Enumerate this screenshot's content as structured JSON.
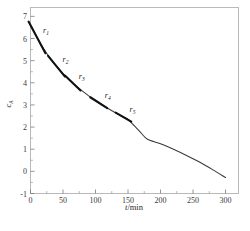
{
  "figure": {
    "background_color": "#ffffff",
    "frame_color": "#b9b9b9",
    "curve_color": "#3a3a3a",
    "tangent_color": "#111111"
  },
  "chart_data": {
    "type": "line",
    "title": "",
    "subtitle": "",
    "xlabel": "t/min",
    "xlabel_symbol": "t",
    "xlabel_unit": "/min",
    "ylabel": "cA",
    "ylabel_symbol": "c",
    "ylabel_subscript": "A",
    "xlim": [
      0,
      320
    ],
    "ylim": [
      -1,
      7.4
    ],
    "xticks": [
      0,
      50,
      100,
      150,
      200,
      250,
      300
    ],
    "xtick_labels": [
      "0",
      "50",
      "100",
      "150",
      "200",
      "250",
      "300"
    ],
    "xminor_step": 25,
    "yticks": [
      -1,
      0,
      1,
      2,
      3,
      4,
      5,
      6,
      7
    ],
    "ytick_labels": [
      "-1",
      "0",
      "1",
      "2",
      "3",
      "4",
      "5",
      "6",
      "7"
    ],
    "yminor_step": 0.5,
    "grid": false,
    "legend": false,
    "series": [
      {
        "name": "cA",
        "x": [
          0,
          10,
          20,
          30,
          40,
          50,
          60,
          70,
          80,
          90,
          100,
          110,
          120,
          130,
          140,
          150,
          160,
          170,
          180,
          200,
          220,
          240,
          260,
          280,
          300
        ],
        "y": [
          6.6,
          6.05,
          5.55,
          5.12,
          4.75,
          4.42,
          4.12,
          3.86,
          3.62,
          3.4,
          3.2,
          3.01,
          2.83,
          2.66,
          2.5,
          2.34,
          2.05,
          1.74,
          1.45,
          1.25,
          1.0,
          0.72,
          0.42,
          0.08,
          -0.28
        ]
      }
    ],
    "annotations": [
      {
        "label": "r1",
        "symbol": "r",
        "subscript": "1",
        "t": 10,
        "c": 6.05,
        "slope": -0.055,
        "half_len": 13,
        "label_dx": 9,
        "label_dy": -4
      },
      {
        "label": "r2",
        "symbol": "r",
        "subscript": "2",
        "t": 40,
        "c": 4.75,
        "slope": -0.036,
        "half_len": 13,
        "label_dx": 9,
        "label_dy": -4
      },
      {
        "label": "r3",
        "symbol": "r",
        "subscript": "3",
        "t": 65,
        "c": 3.99,
        "slope": -0.028,
        "half_len": 12,
        "label_dx": 9,
        "label_dy": -4
      },
      {
        "label": "r4",
        "symbol": "r",
        "subscript": "4",
        "t": 105,
        "c": 3.1,
        "slope": -0.019,
        "half_len": 13,
        "label_dx": 9,
        "label_dy": -5
      },
      {
        "label": "r5",
        "symbol": "r",
        "subscript": "5",
        "t": 143,
        "c": 2.45,
        "slope": -0.017,
        "half_len": 12,
        "label_dx": 9,
        "label_dy": -5
      }
    ]
  },
  "caption": {
    "text": ""
  }
}
